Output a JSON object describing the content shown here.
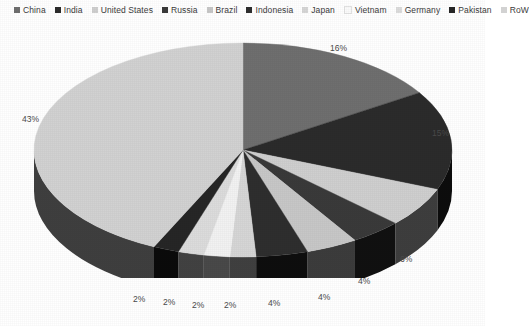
{
  "chart_data": {
    "type": "pie",
    "title": "",
    "legend_position": "top",
    "three_d": true,
    "start_angle_deg": 0,
    "direction": "clockwise",
    "categories": [
      "China",
      "India",
      "United States",
      "Russia",
      "Brazil",
      "Indonesia",
      "Japan",
      "Vietnam",
      "Germany",
      "Pakistan",
      "RoW"
    ],
    "values": [
      16,
      15,
      6,
      4,
      4,
      4,
      2,
      2,
      2,
      2,
      43
    ],
    "labels": [
      "16%",
      "15%",
      "6%",
      "4%",
      "4%",
      "4%",
      "2%",
      "2%",
      "2%",
      "2%",
      "43%"
    ],
    "colors": [
      "#6f6f6f",
      "#2b2b2b",
      "#cfcfcf",
      "#3a3a3a",
      "#c7c7c7",
      "#2e2e2e",
      "#d6d6d6",
      "#f2f2f2",
      "#dcdcdc",
      "#262626",
      "#d2d2d2"
    ],
    "units": "percent",
    "total": 100
  },
  "legend": {
    "items": [
      {
        "label": "China",
        "color": "#6f6f6f"
      },
      {
        "label": "India",
        "color": "#2b2b2b"
      },
      {
        "label": "United States",
        "color": "#cfcfcf"
      },
      {
        "label": "Russia",
        "color": "#3a3a3a"
      },
      {
        "label": "Brazil",
        "color": "#c7c7c7"
      },
      {
        "label": "Indonesia",
        "color": "#2e2e2e"
      },
      {
        "label": "Japan",
        "color": "#d6d6d6"
      },
      {
        "label": "Vietnam",
        "color": "#fbfbfb"
      },
      {
        "label": "Germany",
        "color": "#dcdcdc"
      },
      {
        "label": "Pakistan",
        "color": "#262626"
      },
      {
        "label": "RoW",
        "color": "#d2d2d2"
      }
    ]
  },
  "value_labels": {
    "china": {
      "text": "16%",
      "x": 330,
      "y": 43
    },
    "india": {
      "text": "15%",
      "x": 432,
      "y": 128
    },
    "us": {
      "text": "6%",
      "x": 400,
      "y": 254
    },
    "russia": {
      "text": "4%",
      "x": 358,
      "y": 276
    },
    "brazil": {
      "text": "4%",
      "x": 318,
      "y": 292
    },
    "indonesia": {
      "text": "4%",
      "x": 268,
      "y": 298
    },
    "japan": {
      "text": "2%",
      "x": 224,
      "y": 300
    },
    "vietnam": {
      "text": "2%",
      "x": 192,
      "y": 300
    },
    "germany": {
      "text": "2%",
      "x": 163,
      "y": 297
    },
    "pakistan": {
      "text": "2%",
      "x": 133,
      "y": 294
    },
    "row": {
      "text": "43%",
      "x": 22,
      "y": 114
    }
  }
}
